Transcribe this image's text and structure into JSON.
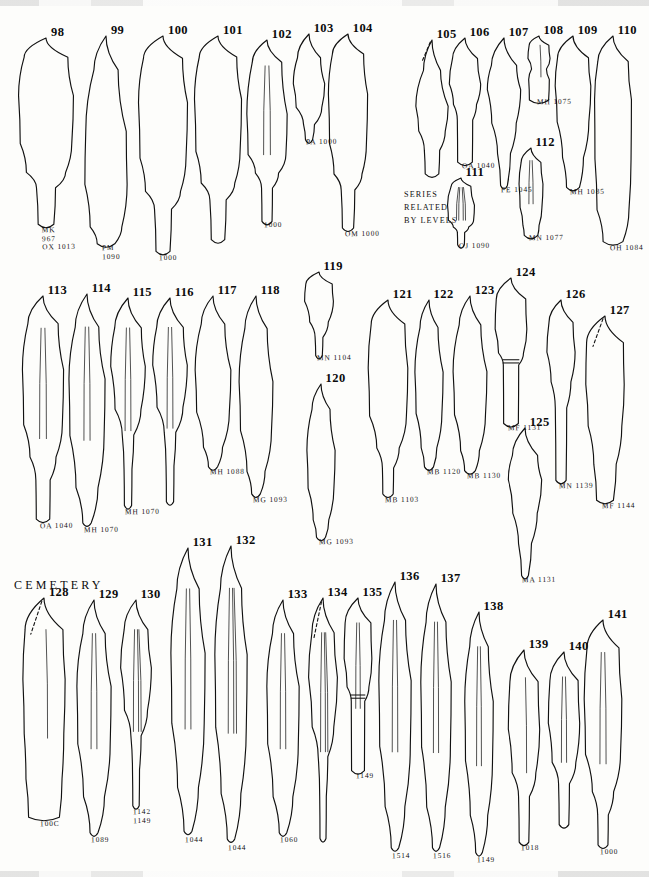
{
  "plate": {
    "title": "CEMETERY",
    "note_lines": [
      "SERIES",
      "RELATED",
      "BY LEVELS"
    ],
    "ink_color": "#111111",
    "background_color": "#fdfdfb",
    "specimen_count": 44,
    "row_count": 3
  },
  "rows": [
    {
      "name": "row-1",
      "figure_range": "98-112"
    },
    {
      "name": "row-2",
      "figure_range": "113-127"
    },
    {
      "name": "row-3",
      "figure_range": "128-141"
    }
  ],
  "specimens": [
    {
      "num": "98",
      "catalog": "MK\n967\nOX 1013",
      "row": 1,
      "x": 18,
      "y": 38,
      "w": 56,
      "h": 192,
      "shape": "long-stemmed-blade",
      "flakes": 0,
      "dashed_tip": false,
      "band": false
    },
    {
      "num": "99",
      "catalog": "PM\n1090",
      "row": 1,
      "x": 84,
      "y": 36,
      "w": 44,
      "h": 212,
      "shape": "narrow-lanceolate",
      "flakes": 0,
      "dashed_tip": false,
      "band": false
    },
    {
      "num": "100",
      "catalog": "1000",
      "row": 1,
      "x": 138,
      "y": 36,
      "w": 50,
      "h": 222,
      "shape": "long-stemmed-blade",
      "flakes": 0,
      "dashed_tip": false,
      "band": false
    },
    {
      "num": "101",
      "catalog": "",
      "row": 1,
      "x": 194,
      "y": 36,
      "w": 48,
      "h": 210,
      "shape": "long-stemmed-blade",
      "flakes": 0,
      "dashed_tip": false,
      "band": false
    },
    {
      "num": "102",
      "catalog": "1000",
      "row": 1,
      "x": 246,
      "y": 40,
      "w": 42,
      "h": 185,
      "shape": "fluted-stemmed",
      "flakes": 2,
      "dashed_tip": false,
      "band": false
    },
    {
      "num": "103",
      "catalog": "PA 1000",
      "row": 1,
      "x": 293,
      "y": 34,
      "w": 32,
      "h": 108,
      "shape": "leaf-point",
      "flakes": 0,
      "dashed_tip": false,
      "band": false
    },
    {
      "num": "104",
      "catalog": "OM 1000",
      "row": 1,
      "x": 328,
      "y": 34,
      "w": 40,
      "h": 200,
      "shape": "long-stemmed-blade",
      "flakes": 0,
      "dashed_tip": false,
      "band": false
    },
    {
      "num": "105",
      "catalog": "",
      "row": 1,
      "x": 415,
      "y": 40,
      "w": 34,
      "h": 138,
      "shape": "slender-biface",
      "flakes": 0,
      "dashed_tip": true,
      "band": false
    },
    {
      "num": "106",
      "catalog": "OA 1040",
      "row": 1,
      "x": 449,
      "y": 38,
      "w": 32,
      "h": 128,
      "shape": "stemmed-short",
      "flakes": 0,
      "dashed_tip": false,
      "band": false
    },
    {
      "num": "107",
      "catalog": "FE 1045",
      "row": 1,
      "x": 487,
      "y": 38,
      "w": 34,
      "h": 152,
      "shape": "long-taper-point",
      "flakes": 0,
      "dashed_tip": false,
      "band": false
    },
    {
      "num": "108",
      "catalog": "MH 1075",
      "row": 1,
      "x": 527,
      "y": 36,
      "w": 24,
      "h": 66,
      "shape": "waisted-fragment",
      "flakes": 1,
      "dashed_tip": false,
      "band": false
    },
    {
      "num": "109",
      "catalog": "MH 1085",
      "row": 1,
      "x": 555,
      "y": 36,
      "w": 36,
      "h": 156,
      "shape": "heavy-lanceolate",
      "flakes": 0,
      "dashed_tip": false,
      "band": false
    },
    {
      "num": "110",
      "catalog": "OH 1084",
      "row": 1,
      "x": 594,
      "y": 36,
      "w": 38,
      "h": 212,
      "shape": "long-parallel-blade",
      "flakes": 0,
      "dashed_tip": false,
      "band": false
    },
    {
      "num": "111",
      "catalog": "OJ 1090",
      "row": 1,
      "x": 447,
      "y": 178,
      "w": 28,
      "h": 68,
      "shape": "fluted-stemmed",
      "flakes": 4,
      "dashed_tip": false,
      "band": false
    },
    {
      "num": "112",
      "catalog": "MN 1077",
      "row": 1,
      "x": 518,
      "y": 148,
      "w": 26,
      "h": 90,
      "shape": "narrow-fluted",
      "flakes": 2,
      "dashed_tip": false,
      "band": false
    },
    {
      "num": "113",
      "catalog": "OA 1040",
      "row": 2,
      "x": 22,
      "y": 296,
      "w": 42,
      "h": 230,
      "shape": "ridged-stemmed-blade",
      "flakes": 2,
      "dashed_tip": false,
      "band": false
    },
    {
      "num": "114",
      "catalog": "MH 1070",
      "row": 2,
      "x": 68,
      "y": 294,
      "w": 38,
      "h": 236,
      "shape": "ridged-lanceolate",
      "flakes": 2,
      "dashed_tip": false,
      "band": false
    },
    {
      "num": "115",
      "catalog": "MH 1070",
      "row": 2,
      "x": 110,
      "y": 298,
      "w": 36,
      "h": 214,
      "shape": "fluted-long-stem",
      "flakes": 2,
      "dashed_tip": false,
      "band": false
    },
    {
      "num": "116",
      "catalog": "",
      "row": 2,
      "x": 152,
      "y": 298,
      "w": 36,
      "h": 210,
      "shape": "fluted-long-stem",
      "flakes": 2,
      "dashed_tip": false,
      "band": false
    },
    {
      "num": "117",
      "catalog": "MH 1088",
      "row": 2,
      "x": 194,
      "y": 296,
      "w": 38,
      "h": 176,
      "shape": "plain-lanceolate",
      "flakes": 0,
      "dashed_tip": false,
      "band": false
    },
    {
      "num": "118",
      "catalog": "MG 1093",
      "row": 2,
      "x": 238,
      "y": 296,
      "w": 36,
      "h": 204,
      "shape": "plain-lanceolate",
      "flakes": 0,
      "dashed_tip": false,
      "band": false
    },
    {
      "num": "119",
      "catalog": "MN 1104",
      "row": 2,
      "x": 304,
      "y": 272,
      "w": 30,
      "h": 86,
      "shape": "round-top-stem",
      "flakes": 0,
      "dashed_tip": false,
      "band": false
    },
    {
      "num": "120",
      "catalog": "MG 1093",
      "row": 2,
      "x": 306,
      "y": 384,
      "w": 30,
      "h": 158,
      "shape": "narrow-biconvex",
      "flakes": 0,
      "dashed_tip": false,
      "band": false
    },
    {
      "num": "121",
      "catalog": "MB 1103",
      "row": 2,
      "x": 368,
      "y": 300,
      "w": 40,
      "h": 200,
      "shape": "broad-ovate-stem",
      "flakes": 0,
      "dashed_tip": false,
      "band": false
    },
    {
      "num": "122",
      "catalog": "MB 1120",
      "row": 2,
      "x": 414,
      "y": 300,
      "w": 30,
      "h": 172,
      "shape": "narrow-biconvex",
      "flakes": 0,
      "dashed_tip": false,
      "band": false
    },
    {
      "num": "123",
      "catalog": "MB 1130",
      "row": 2,
      "x": 452,
      "y": 296,
      "w": 36,
      "h": 180,
      "shape": "narrow-biconvex",
      "flakes": 0,
      "dashed_tip": false,
      "band": false
    },
    {
      "num": "124",
      "catalog": "MF 1131",
      "row": 2,
      "x": 495,
      "y": 278,
      "w": 32,
      "h": 150,
      "shape": "spatulate-haft",
      "flakes": 0,
      "dashed_tip": false,
      "band": true
    },
    {
      "num": "125",
      "catalog": "MA 1131",
      "row": 2,
      "x": 508,
      "y": 428,
      "w": 34,
      "h": 152,
      "shape": "long-taper-point",
      "flakes": 0,
      "dashed_tip": false,
      "band": false
    },
    {
      "num": "126",
      "catalog": "MN 1139",
      "row": 2,
      "x": 546,
      "y": 300,
      "w": 30,
      "h": 186,
      "shape": "shouldered-long-stem",
      "flakes": 0,
      "dashed_tip": false,
      "band": false
    },
    {
      "num": "127",
      "catalog": "MF 1144",
      "row": 2,
      "x": 585,
      "y": 316,
      "w": 40,
      "h": 190,
      "shape": "broken-edge-blade",
      "flakes": 0,
      "dashed_tip": true,
      "band": false
    },
    {
      "num": "128",
      "catalog": "100C",
      "row": 3,
      "x": 22,
      "y": 598,
      "w": 44,
      "h": 226,
      "shape": "irregular-base-blade",
      "flakes": 1,
      "dashed_tip": true,
      "band": false
    },
    {
      "num": "129",
      "catalog": "1089",
      "row": 3,
      "x": 76,
      "y": 600,
      "w": 36,
      "h": 240,
      "shape": "ridged-lanceolate",
      "flakes": 2,
      "dashed_tip": false,
      "band": false
    },
    {
      "num": "130",
      "catalog": "1142\n1149",
      "row": 3,
      "x": 120,
      "y": 600,
      "w": 32,
      "h": 212,
      "shape": "fluted-long-stem",
      "flakes": 3,
      "dashed_tip": false,
      "band": false
    },
    {
      "num": "131",
      "catalog": "1044",
      "row": 3,
      "x": 170,
      "y": 548,
      "w": 36,
      "h": 292,
      "shape": "ridged-lanceolate",
      "flakes": 2,
      "dashed_tip": false,
      "band": false
    },
    {
      "num": "132",
      "catalog": "1044",
      "row": 3,
      "x": 214,
      "y": 546,
      "w": 34,
      "h": 302,
      "shape": "ridged-lanceolate",
      "flakes": 3,
      "dashed_tip": false,
      "band": false
    },
    {
      "num": "133",
      "catalog": "1060",
      "row": 3,
      "x": 266,
      "y": 600,
      "w": 34,
      "h": 240,
      "shape": "ridged-lanceolate",
      "flakes": 2,
      "dashed_tip": false,
      "band": false
    },
    {
      "num": "134",
      "catalog": "",
      "row": 3,
      "x": 308,
      "y": 598,
      "w": 30,
      "h": 248,
      "shape": "fluted-long-stem",
      "flakes": 3,
      "dashed_tip": true,
      "band": false
    },
    {
      "num": "135",
      "catalog": "1149",
      "row": 3,
      "x": 344,
      "y": 598,
      "w": 28,
      "h": 178,
      "shape": "spatulate-haft",
      "flakes": 2,
      "dashed_tip": false,
      "band": true
    },
    {
      "num": "136",
      "catalog": "1514",
      "row": 3,
      "x": 378,
      "y": 582,
      "w": 34,
      "h": 274,
      "shape": "ridged-lanceolate",
      "flakes": 2,
      "dashed_tip": false,
      "band": false
    },
    {
      "num": "137",
      "catalog": "1516",
      "row": 3,
      "x": 420,
      "y": 584,
      "w": 32,
      "h": 272,
      "shape": "ridged-lanceolate",
      "flakes": 2,
      "dashed_tip": false,
      "band": false
    },
    {
      "num": "138",
      "catalog": "1149",
      "row": 3,
      "x": 464,
      "y": 612,
      "w": 30,
      "h": 248,
      "shape": "ridged-lanceolate",
      "flakes": 2,
      "dashed_tip": false,
      "band": false
    },
    {
      "num": "139",
      "catalog": "1018",
      "row": 3,
      "x": 508,
      "y": 650,
      "w": 32,
      "h": 198,
      "shape": "ovate-short-stem",
      "flakes": 1,
      "dashed_tip": false,
      "band": false
    },
    {
      "num": "140",
      "catalog": "",
      "row": 3,
      "x": 548,
      "y": 652,
      "w": 32,
      "h": 178,
      "shape": "ovate-short-stem",
      "flakes": 2,
      "dashed_tip": false,
      "band": false
    },
    {
      "num": "141",
      "catalog": "1000",
      "row": 3,
      "x": 584,
      "y": 620,
      "w": 38,
      "h": 232,
      "shape": "broad-ovate-stem",
      "flakes": 2,
      "dashed_tip": false,
      "band": false
    }
  ]
}
